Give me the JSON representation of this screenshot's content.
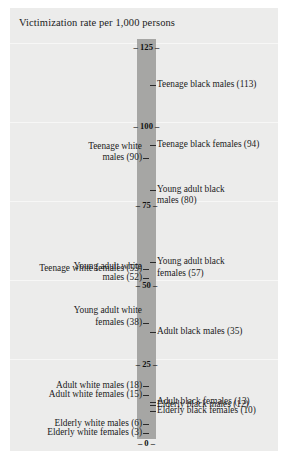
{
  "chart_title": "Victimization rate per 1,000 persons",
  "axis": {
    "ticks": [
      "125",
      "100",
      "75",
      "50",
      "25",
      "0"
    ],
    "max": 125,
    "min": 0
  },
  "chart_data": {
    "type": "bar",
    "title": "Victimization rate per 1,000 persons",
    "xlabel": "",
    "ylabel": "Victimization rate per 1,000 persons",
    "ylim": [
      0,
      125
    ],
    "yticks": [
      0,
      25,
      50,
      75,
      100,
      125
    ],
    "grid": true,
    "legend": "none",
    "orientation": "vertical-scale-annotated",
    "categories": [
      "Teenage black males",
      "Teenage black females",
      "Teenage white males",
      "Young adult black males",
      "Young adult black females",
      "Teenage white females",
      "Young adult white males",
      "Young adult white females",
      "Adult black males",
      "Adult white males",
      "Adult white females",
      "Adult black females",
      "Elderly black males",
      "Elderly black females",
      "Elderly white males",
      "Elderly white females"
    ],
    "values": [
      113,
      94,
      90,
      80,
      57,
      55,
      52,
      38,
      35,
      18,
      15,
      13,
      12,
      10,
      6,
      3
    ]
  },
  "labels": {
    "right": [
      {
        "text": "Teenage black males (113)",
        "value": 113,
        "lines": "Teenage black males (113)"
      },
      {
        "text": "Teenage black females (94)",
        "value": 94,
        "lines": "Teenage black females (94)"
      },
      {
        "text": "Young adult black males (80)",
        "value": 80,
        "lines": "Young adult black\nmales (80)"
      },
      {
        "text": "Young adult black females (57)",
        "value": 57,
        "lines": "Young adult black\nfemales (57)"
      },
      {
        "text": "Adult black males (35)",
        "value": 35,
        "lines": "Adult black males (35)"
      },
      {
        "text": "Adult black females (13)",
        "value": 13,
        "lines": "Adult black females (13)"
      },
      {
        "text": "Elderly black males (12)",
        "value": 12,
        "lines": "Elderly black males (12)"
      },
      {
        "text": "Elderly black females (10)",
        "value": 10,
        "lines": "Elderly black females (10)"
      }
    ],
    "left": [
      {
        "text": "Teenage white males (90)",
        "value": 90,
        "lines": "Teenage white\nmales (90)"
      },
      {
        "text": "Teenage white females (55)",
        "value": 55,
        "lines": "Teenage white females (55)"
      },
      {
        "text": "Young adult white males (52)",
        "value": 52,
        "lines": "Young adult white\nmales (52)"
      },
      {
        "text": "Young adult white females (38)",
        "value": 38,
        "lines": "Young adult white\nfemales (38)"
      },
      {
        "text": "Adult white males (18)",
        "value": 18,
        "lines": "Adult white males (18)"
      },
      {
        "text": "Adult white females (15)",
        "value": 15,
        "lines": "Adult white females (15)"
      },
      {
        "text": "Elderly white males (6)",
        "value": 6,
        "lines": "Elderly white males (6)"
      },
      {
        "text": "Elderly white females (3)",
        "value": 3,
        "lines": "Elderly white females (3)"
      }
    ]
  }
}
